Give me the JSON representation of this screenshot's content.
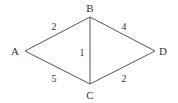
{
  "diagram": {
    "type": "weighted-undirected-graph",
    "nodes": [
      {
        "id": "A",
        "label": "A",
        "x": 25,
        "y": 51,
        "lx": 15,
        "ly": 55
      },
      {
        "id": "B",
        "label": "B",
        "x": 90,
        "y": 17,
        "lx": 90,
        "ly": 12
      },
      {
        "id": "C",
        "label": "C",
        "x": 90,
        "y": 84,
        "lx": 90,
        "ly": 99
      },
      {
        "id": "D",
        "label": "D",
        "x": 155,
        "y": 51,
        "lx": 163,
        "ly": 55
      }
    ],
    "edges": [
      {
        "from": "A",
        "to": "B",
        "weight": "2",
        "wx": 54,
        "wy": 30
      },
      {
        "from": "B",
        "to": "D",
        "weight": "4",
        "wx": 124,
        "wy": 30
      },
      {
        "from": "B",
        "to": "C",
        "weight": "1",
        "wx": 82,
        "wy": 56
      },
      {
        "from": "A",
        "to": "C",
        "weight": "5",
        "wx": 54,
        "wy": 82
      },
      {
        "from": "C",
        "to": "D",
        "weight": "2",
        "wx": 124,
        "wy": 82
      }
    ]
  }
}
